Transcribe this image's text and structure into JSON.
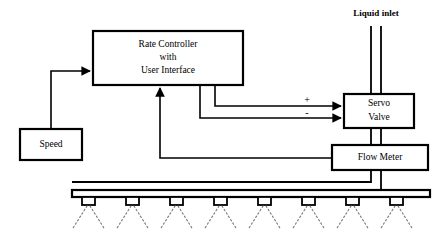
{
  "diagram": {
    "background_color": "#ffffff",
    "line_color": "#000000",
    "spray_color": "#7a7a7a",
    "blocks": [
      {
        "id": "rate-controller",
        "lines": [
          "Rate Controller",
          "with",
          "User Interface"
        ],
        "x": 93,
        "y": 31,
        "w": 150,
        "h": 54
      },
      {
        "id": "speed",
        "lines": [
          "Speed"
        ],
        "x": 20,
        "y": 129,
        "w": 62,
        "h": 31
      },
      {
        "id": "servo-valve",
        "lines": [
          "Servo",
          "Valve"
        ],
        "x": 344,
        "y": 94,
        "w": 70,
        "h": 34
      },
      {
        "id": "flow-meter",
        "lines": [
          "Flow Meter"
        ],
        "x": 332,
        "y": 145,
        "w": 96,
        "h": 25
      }
    ],
    "labels": {
      "liquid_inlet": "Liquid inlet",
      "plus_sign": "+",
      "minus_sign": "-"
    },
    "boom": {
      "nozzle_count": 8,
      "bar_x": 72,
      "bar_y": 190,
      "bar_w": 358,
      "bar_h": 7
    }
  }
}
